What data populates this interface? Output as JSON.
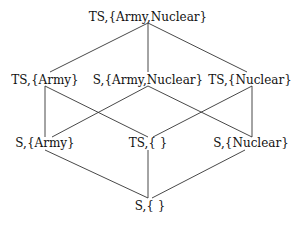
{
  "diagram": {
    "type": "lattice",
    "colors": {
      "edge": "#333333",
      "text": "#111111",
      "background": "#ffffff"
    },
    "nodes": [
      {
        "id": "ts_army_nuclear",
        "label": "TS,{Army,Nuclear}",
        "x": 148,
        "y": 10
      },
      {
        "id": "ts_army",
        "label": "TS,{Army}",
        "x": 45,
        "y": 73
      },
      {
        "id": "s_army_nuclear",
        "label": "S,{Army,Nuclear}",
        "x": 148,
        "y": 73
      },
      {
        "id": "ts_nuclear",
        "label": "TS,{Nuclear}",
        "x": 250,
        "y": 73
      },
      {
        "id": "s_army",
        "label": "S,{Army}",
        "x": 45,
        "y": 136
      },
      {
        "id": "ts_empty",
        "label": "TS,{ }",
        "x": 148,
        "y": 136
      },
      {
        "id": "s_nuclear",
        "label": "S,{Nuclear}",
        "x": 251,
        "y": 136
      },
      {
        "id": "s_empty",
        "label": "S,{ }",
        "x": 150,
        "y": 199
      }
    ],
    "edges": [
      {
        "from": "ts_army_nuclear",
        "to": "ts_army",
        "x1": 148,
        "y1": 23,
        "x2": 50,
        "y2": 72
      },
      {
        "from": "ts_army_nuclear",
        "to": "s_army_nuclear",
        "x1": 148,
        "y1": 23,
        "x2": 148,
        "y2": 72
      },
      {
        "from": "ts_army_nuclear",
        "to": "ts_nuclear",
        "x1": 148,
        "y1": 23,
        "x2": 247,
        "y2": 72
      },
      {
        "from": "ts_army",
        "to": "s_army",
        "x1": 45,
        "y1": 86,
        "x2": 45,
        "y2": 137
      },
      {
        "from": "ts_army",
        "to": "ts_empty",
        "x1": 45,
        "y1": 86,
        "x2": 148,
        "y2": 137
      },
      {
        "from": "s_army_nuclear",
        "to": "s_army",
        "x1": 148,
        "y1": 86,
        "x2": 52,
        "y2": 137
      },
      {
        "from": "s_army_nuclear",
        "to": "s_nuclear",
        "x1": 148,
        "y1": 86,
        "x2": 252,
        "y2": 137
      },
      {
        "from": "ts_nuclear",
        "to": "s_nuclear",
        "x1": 252,
        "y1": 86,
        "x2": 252,
        "y2": 137
      },
      {
        "from": "ts_nuclear",
        "to": "ts_empty",
        "x1": 252,
        "y1": 86,
        "x2": 153,
        "y2": 137
      },
      {
        "from": "s_army",
        "to": "s_empty",
        "x1": 45,
        "y1": 150,
        "x2": 148,
        "y2": 198
      },
      {
        "from": "ts_empty",
        "to": "s_empty",
        "x1": 148,
        "y1": 150,
        "x2": 148,
        "y2": 198
      },
      {
        "from": "s_nuclear",
        "to": "s_empty",
        "x1": 245,
        "y1": 150,
        "x2": 152,
        "y2": 198
      }
    ]
  }
}
